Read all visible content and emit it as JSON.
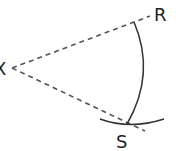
{
  "diagram": {
    "type": "geometric-construction",
    "labels": {
      "vertex": "X",
      "upper_point": "R",
      "lower_point": "S"
    },
    "colors": {
      "stroke": "#333333",
      "dashed": "#555555",
      "background": "#ffffff"
    },
    "elements": [
      {
        "kind": "dashed-ray",
        "from": "X",
        "to": "R"
      },
      {
        "kind": "dashed-ray",
        "from": "X",
        "through": "S"
      },
      {
        "kind": "arc",
        "from": "R",
        "to": "S"
      },
      {
        "kind": "arc",
        "crossing": "S"
      }
    ]
  }
}
